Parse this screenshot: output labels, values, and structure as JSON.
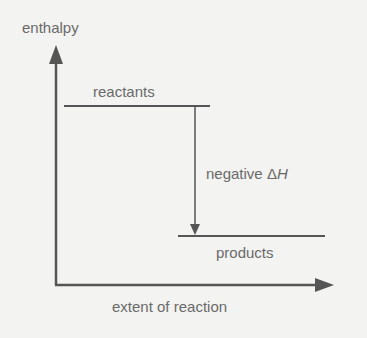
{
  "diagram": {
    "y_axis_label": "enthalpy",
    "x_axis_label": "extent of reaction",
    "levels": [
      {
        "name": "reactants",
        "label": "reactants"
      },
      {
        "name": "products",
        "label": "products"
      }
    ],
    "change_label_prefix": "negative ",
    "change_symbol_delta": "Δ",
    "change_symbol_var": "H",
    "colors": {
      "background": "#f3f3f1",
      "lines": "#555555",
      "text": "#6a6a6a"
    }
  }
}
